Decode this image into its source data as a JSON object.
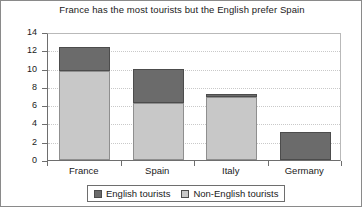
{
  "chart_data": {
    "type": "bar",
    "subtype": "stacked-vertical-bar",
    "title": "France has the most tourists but the English prefer Spain",
    "xlabel": "",
    "ylabel": "",
    "categories": [
      "France",
      "Spain",
      "Italy",
      "Germany"
    ],
    "series": [
      {
        "name": "English tourists",
        "color": "#6b6b6b",
        "values": [
          2.7,
          3.8,
          0.35,
          3.1
        ]
      },
      {
        "name": "Non-English tourists",
        "color": "#c8c8c8",
        "values": [
          9.7,
          6.2,
          6.9,
          0
        ]
      }
    ],
    "stack_totals": [
      12.4,
      10.0,
      7.25,
      3.1
    ],
    "ylim": [
      0,
      14
    ],
    "yticks": [
      0,
      2,
      4,
      6,
      8,
      10,
      12,
      14
    ],
    "ytick_labels": [
      "0",
      "2",
      "4",
      "6",
      "8",
      "10",
      "12",
      "14"
    ],
    "grid": true,
    "grid_axis": "y",
    "grid_style": "dotted",
    "grid_color": "#c9c9c9",
    "legend_position": "bottom-center",
    "legend_entries": [
      "English tourists",
      "Non-English tourists"
    ],
    "stack_order_bottom_to_top": [
      "Non-English tourists",
      "English tourists"
    ],
    "background_color": "#ffffff",
    "axis_color": "#6e6e6e",
    "text_color": "#1a1a1a"
  },
  "legend": {
    "items": [
      {
        "label": "English tourists",
        "color": "#6b6b6b"
      },
      {
        "label": "Non-English tourists",
        "color": "#c8c8c8"
      }
    ]
  }
}
